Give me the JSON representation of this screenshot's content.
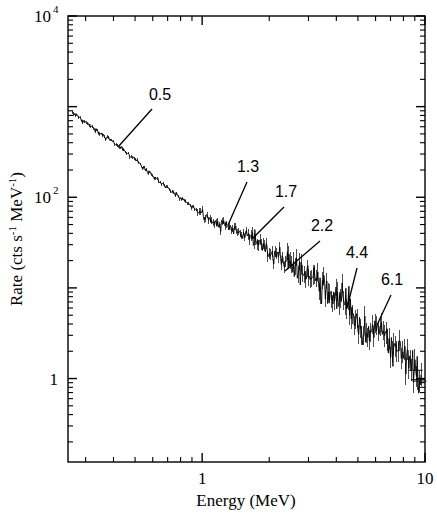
{
  "figure": {
    "background": "#ffffff",
    "ink": "#000000"
  },
  "chart_data": {
    "type": "line",
    "title": "",
    "subtitle": "",
    "xlabel": "Energy (MeV)",
    "ylabel": "Rate (cts s-1 MeV-1)",
    "ylabel_parts": {
      "lead": "Rate (cts s",
      "sup1": "-1",
      "mid": " MeV",
      "sup2": "-1",
      "tail": ")"
    },
    "xscale": "log",
    "yscale": "log",
    "xlim": [
      0.25,
      10.0
    ],
    "ylim": [
      0.12,
      10000.0
    ],
    "grid": false,
    "legend": null,
    "legend_position": "none",
    "xticks_major": [
      {
        "value": 1,
        "label": "1"
      },
      {
        "value": 10,
        "label": "10"
      }
    ],
    "xticks_minor": [
      0.3,
      0.4,
      0.5,
      0.6,
      0.7,
      0.8,
      0.9,
      2,
      3,
      4,
      5,
      6,
      7,
      8,
      9
    ],
    "yticks_major": [
      {
        "value": 10000,
        "label_base": "10",
        "label_exp": "4"
      },
      {
        "value": 100,
        "label_base": "10",
        "label_exp": "2"
      },
      {
        "value": 1,
        "label_base": "1",
        "label_exp": ""
      }
    ],
    "yticks_minor_decades": [
      10000,
      1000,
      100,
      10,
      1
    ],
    "series": [
      {
        "name": "count rate spectrum",
        "style": "stepped-line-with-errorbars",
        "color": "#000000",
        "x": [
          0.262,
          0.272,
          0.283,
          0.294,
          0.306,
          0.318,
          0.331,
          0.344,
          0.358,
          0.372,
          0.387,
          0.402,
          0.418,
          0.435,
          0.452,
          0.47,
          0.489,
          0.508,
          0.529,
          0.55,
          0.572,
          0.595,
          0.618,
          0.643,
          0.669,
          0.695,
          0.723,
          0.752,
          0.782,
          0.813,
          0.845,
          0.879,
          0.914,
          0.95,
          0.988,
          1.028,
          1.069,
          1.111,
          1.156,
          1.202,
          1.25,
          1.3,
          1.352,
          1.406,
          1.462,
          1.521,
          1.581,
          1.644,
          1.71,
          1.778,
          1.849,
          1.923,
          2.0,
          2.08,
          2.163,
          2.249,
          2.339,
          2.433,
          2.53,
          2.631,
          2.736,
          2.846,
          2.959,
          3.078,
          3.201,
          3.329,
          3.462,
          3.6,
          3.744,
          3.894,
          4.05,
          4.212,
          4.38,
          4.555,
          4.738,
          4.927,
          5.124,
          5.329,
          5.542,
          5.764,
          5.994,
          6.234,
          6.484,
          6.743,
          7.013,
          7.293,
          7.585,
          7.888,
          8.204,
          8.532,
          8.873,
          9.228,
          9.597
        ],
        "y": [
          860,
          800,
          745,
          690,
          640,
          600,
          560,
          520,
          490,
          460,
          430,
          400,
          372,
          345,
          318,
          292,
          268,
          246,
          226,
          208,
          192,
          176,
          162,
          150,
          138,
          128,
          118,
          110,
          102,
          95,
          89,
          83,
          77,
          72,
          67,
          62,
          58,
          54,
          51,
          48,
          46,
          45,
          44,
          43,
          42,
          40,
          37,
          35,
          36,
          33,
          30,
          27,
          25,
          23,
          22,
          21,
          20,
          19,
          18,
          17,
          16,
          15,
          14,
          13,
          12,
          11,
          10,
          9,
          8.2,
          7.5,
          6.8,
          6.2,
          5.6,
          5.1,
          4.7,
          4.3,
          4.0,
          3.7,
          3.4,
          3.2,
          3.0,
          2.8,
          2.6,
          2.45,
          2.3,
          2.15,
          2.0,
          1.85,
          1.7,
          1.55,
          1.4,
          1.25,
          1.1
        ]
      }
    ],
    "annotations": [
      {
        "label": "0.5",
        "peak_energy": 0.5,
        "text_x": 160,
        "text_y": 100,
        "leader_x1": 152,
        "leader_y1": 109,
        "leader_x2": 118,
        "leader_y2": 147
      },
      {
        "label": "1.3",
        "peak_energy": 1.3,
        "text_x": 248,
        "text_y": 172,
        "leader_x1": 247,
        "leader_y1": 182,
        "leader_x2": 228,
        "leader_y2": 225
      },
      {
        "label": "1.7",
        "peak_energy": 1.7,
        "text_x": 286,
        "text_y": 197,
        "leader_x1": 284,
        "leader_y1": 207,
        "leader_x2": 252,
        "leader_y2": 239
      },
      {
        "label": "2.2",
        "peak_energy": 2.2,
        "text_x": 322,
        "text_y": 231,
        "leader_x1": 320,
        "leader_y1": 241,
        "leader_x2": 285,
        "leader_y2": 271
      },
      {
        "label": "4.4",
        "peak_energy": 4.4,
        "text_x": 357,
        "text_y": 258,
        "leader_x1": 357,
        "leader_y1": 268,
        "leader_x2": 347,
        "leader_y2": 308
      },
      {
        "label": "6.1",
        "peak_energy": 6.1,
        "text_x": 392,
        "text_y": 285,
        "leader_x1": 391,
        "leader_y1": 295,
        "leader_x2": 377,
        "leader_y2": 325
      }
    ]
  }
}
